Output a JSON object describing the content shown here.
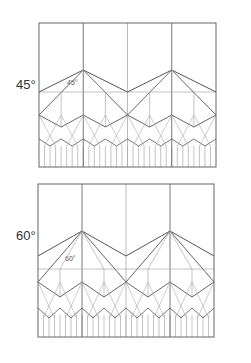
{
  "diagrams": [
    {
      "id": "pattern-45",
      "label": "45°",
      "inner_label": "45°",
      "label_pos": {
        "x": 16,
        "y": 85
      },
      "inner_label_pos": {
        "x": 67,
        "y": 84
      },
      "frame": {
        "x": 39,
        "y": 23,
        "w": 177,
        "h": 144
      },
      "levels": {
        "big_peak_y": 70,
        "big_valley_y": 92,
        "mid_peak_y": 115,
        "mid_valley_y": 127,
        "small_peak_y": 139,
        "small_valley_y": 146,
        "tiny_y": 150,
        "pleat_top_y": 146
      }
    },
    {
      "id": "pattern-60",
      "label": "60°",
      "inner_label": "60°",
      "label_pos": {
        "x": 16,
        "y": 236
      },
      "inner_label_pos": {
        "x": 65,
        "y": 260
      },
      "frame": {
        "x": 38,
        "y": 184,
        "w": 176,
        "h": 153
      },
      "levels": {
        "big_peak_y": 231,
        "big_valley_y": 256,
        "mid_peak_y": 282,
        "mid_valley_y": 297,
        "small_peak_y": 308,
        "small_valley_y": 318,
        "tiny_y": 322,
        "pleat_top_y": 315,
        "horizontal_y": 269
      }
    }
  ],
  "colors": {
    "dark_line": "#555555",
    "light_line": "#aaaaaa",
    "frame": "#666666"
  }
}
